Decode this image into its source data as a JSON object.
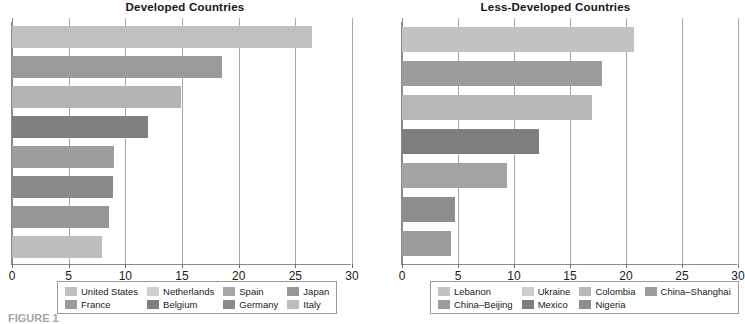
{
  "figure": {
    "caption": "FIGURE 1"
  },
  "chart_data": [
    {
      "type": "bar",
      "orientation": "horizontal",
      "title": "Developed Countries",
      "xlabel": "",
      "ylabel": "",
      "xlim": [
        0,
        30
      ],
      "xticks": [
        0,
        5,
        10,
        15,
        20,
        25,
        30
      ],
      "xticklabels": [
        "0",
        "5",
        "10",
        "15",
        "20",
        "25",
        "30"
      ],
      "grid": true,
      "grid_axis": "x",
      "legend_position": "bottom",
      "categories": [
        "United States",
        "France",
        "Netherlands",
        "Belgium",
        "Spain",
        "Germany",
        "Japan",
        "Italy"
      ],
      "values": [
        26.5,
        18.5,
        14.9,
        12.0,
        9.0,
        8.9,
        8.6,
        7.9
      ],
      "colors": [
        "#c0c0c0",
        "#9a9a9a",
        "#b4b4b4",
        "#808080",
        "#9d9d9d",
        "#8a8a8a",
        "#969696",
        "#bdbdbd"
      ],
      "legend": [
        {
          "label": "United States",
          "color": "#c0c0c0"
        },
        {
          "label": "France",
          "color": "#9a9a9a"
        },
        {
          "label": "Netherlands",
          "color": "#cfcfcf"
        },
        {
          "label": "Belgium",
          "color": "#808080"
        },
        {
          "label": "Spain",
          "color": "#a6a6a6"
        },
        {
          "label": "Germany",
          "color": "#8a8a8a"
        },
        {
          "label": "Japan",
          "color": "#969696"
        },
        {
          "label": "Italy",
          "color": "#bdbdbd"
        }
      ]
    },
    {
      "type": "bar",
      "orientation": "horizontal",
      "title": "Less-Developed Countries",
      "xlabel": "",
      "ylabel": "",
      "xlim": [
        0,
        30
      ],
      "xticks": [
        0,
        5,
        10,
        15,
        20,
        25,
        30
      ],
      "xticklabels": [
        "0",
        "5",
        "10",
        "15",
        "20",
        "25",
        "30"
      ],
      "grid": true,
      "grid_axis": "x",
      "legend_position": "bottom",
      "categories": [
        "Lebanon",
        "China–Beijing",
        "Ukraine",
        "Mexico",
        "Colombia",
        "Nigeria",
        "China–Shanghai"
      ],
      "values": [
        20.7,
        17.9,
        17.0,
        12.2,
        9.4,
        4.7,
        4.4
      ],
      "colors": [
        "#c2c2c2",
        "#9c9c9c",
        "#b8b8b8",
        "#7e7e7e",
        "#a4a4a4",
        "#8d8d8d",
        "#9b9b9b"
      ],
      "legend": [
        {
          "label": "Lebanon",
          "color": "#c2c2c2"
        },
        {
          "label": "China–Beijing",
          "color": "#9c9c9c"
        },
        {
          "label": "Ukraine",
          "color": "#cccccc"
        },
        {
          "label": "Mexico",
          "color": "#7e7e7e"
        },
        {
          "label": "Colombia",
          "color": "#b8b8b8"
        },
        {
          "label": "Nigeria",
          "color": "#8d8d8d"
        },
        {
          "label": "China–Shanghai",
          "color": "#9b9b9b"
        }
      ]
    }
  ]
}
